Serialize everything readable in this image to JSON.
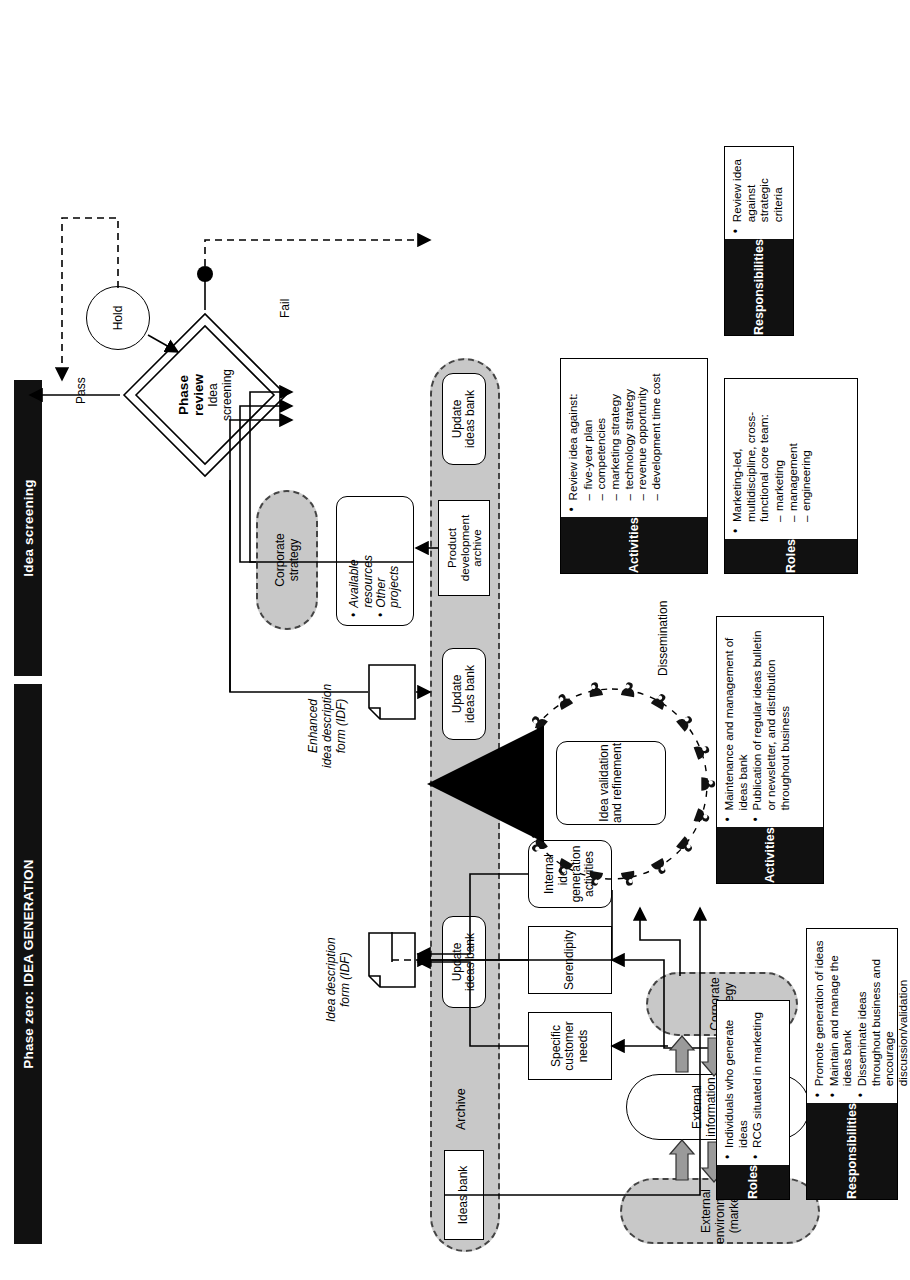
{
  "diagram": {
    "banners": [
      {
        "id": "phase-zero",
        "label": "Phase zero: IDEA GENERATION"
      },
      {
        "id": "idea-screening",
        "label": "Idea screening"
      }
    ],
    "environment": {
      "external_environment": "External environment\n(market)",
      "external_environment_line1": "External environment",
      "external_environment_line2": "(market)",
      "corporate_strategy": "Corporate strategy",
      "corporate_strategy_line1": "Corporate",
      "corporate_strategy_line2": "strategy"
    },
    "process_nodes": {
      "external_info": "External information\ngathering activities",
      "external_info_l1": "External information",
      "external_info_l2": "gathering activities",
      "specific_customer_needs_l1": "Specific",
      "specific_customer_needs_l2": "customer",
      "specific_customer_needs_l3": "needs",
      "serendipity": "Serendipity",
      "internal_idea_l1": "Internal",
      "internal_idea_l2": "idea",
      "internal_idea_l3": "generation",
      "internal_idea_l4": "activities",
      "idea_validation_l1": "Idea validation",
      "idea_validation_l2": "and refinement",
      "dissemination": "Dissemination",
      "available_resources_l1": "Available",
      "available_resources_l2": "resources",
      "other_projects_l1": "Other",
      "other_projects_l2": "projects"
    },
    "documents": {
      "idf_l1": "Idea description",
      "idf_l2": "form (IDF)",
      "enhanced_idf_l1": "Enhanced",
      "enhanced_idf_l2": "idea description",
      "enhanced_idf_l3": "form (IDF)"
    },
    "archive": {
      "lane_label": "Archive",
      "ideas_bank": "Ideas bank",
      "update_ideas_bank_l1": "Update",
      "update_ideas_bank_l2": "ideas bank",
      "product_dev_archive_l1": "Product",
      "product_dev_archive_l2": "development",
      "product_dev_archive_l3": "archive",
      "update_nodes": [
        "Update ideas bank",
        "Update ideas bank",
        "Update ideas bank"
      ]
    },
    "decision": {
      "title_l1": "Phase",
      "title_l2": "review",
      "subtitle_l1": "Idea",
      "subtitle_l2": "screening",
      "pass": "Pass",
      "fail": "Fail",
      "hold": "Hold"
    },
    "panels": [
      {
        "id": "gen-activities",
        "title": "Activities",
        "items": [
          "Maintenance and management of ideas bank",
          "Publication of regular ideas bulletin or newsletter, and distribution throughout business"
        ],
        "sub": []
      },
      {
        "id": "gen-roles",
        "title": "Roles",
        "items": [
          "Individuals who generate ideas",
          "RCG situated in marketing"
        ],
        "sub": []
      },
      {
        "id": "gen-responsibilities",
        "title": "Responsibilities",
        "items": [
          "Promote generation of ideas",
          "Maintain and manage the ideas bank",
          "Disseminate ideas throughout business and encourage discussion/validation"
        ],
        "sub": []
      },
      {
        "id": "screen-activities",
        "title": "Activities",
        "items": [
          "Review idea against:"
        ],
        "sub": [
          "five-year plan",
          "competencies",
          "marketing strategy",
          "technology strategy",
          "revenue opportunity",
          "development time cost"
        ]
      },
      {
        "id": "screen-roles",
        "title": "Roles",
        "items": [
          "Marketing-led, multidiscipline, cross-functional core team:"
        ],
        "sub": [
          "marketing",
          "management",
          "engineering"
        ]
      },
      {
        "id": "screen-responsibilities",
        "title": "Responsibilities",
        "items": [
          "Review idea against strategic criteria"
        ],
        "sub": []
      }
    ],
    "colors": {
      "banner_bg": "#111111",
      "grey_fill": "#c8c8c8",
      "line": "#000000",
      "page_bg": "#ffffff"
    }
  }
}
